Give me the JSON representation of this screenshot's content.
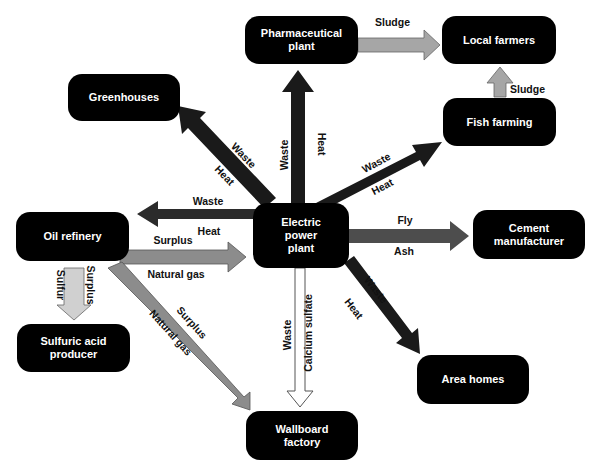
{
  "diagram": {
    "nodes": {
      "pharma": "Pharmaceutical plant",
      "local_farmers": "Local farmers",
      "greenhouses": "Greenhouses",
      "fish_farming": "Fish farming",
      "oil_refinery": "Oil refinery",
      "power_plant": "Electric power plant",
      "cement": "Cement manufacturer",
      "sulfuric": "Sulfuric acid producer",
      "area_homes": "Area homes",
      "wallboard": "Wallboard factory"
    },
    "node_lines": {
      "pharma": [
        "Pharmaceutical",
        "plant"
      ],
      "power_plant": [
        "Electric",
        "power",
        "plant"
      ],
      "cement": [
        "Cement",
        "manufacturer"
      ],
      "sulfuric": [
        "Sulfuric acid",
        "producer"
      ],
      "wallboard": [
        "Wallboard",
        "factory"
      ]
    },
    "flows": [
      {
        "from": "Pharmaceutical plant",
        "to": "Local farmers",
        "labels": [
          "Sludge"
        ],
        "color": "#a6a6a6"
      },
      {
        "from": "Fish farming",
        "to": "Local farmers",
        "labels": [
          "Sludge"
        ],
        "color": "#a6a6a6"
      },
      {
        "from": "Electric power plant",
        "to": "Pharmaceutical plant",
        "labels": [
          "Waste",
          "Heat"
        ],
        "color": "#2b2b2b"
      },
      {
        "from": "Electric power plant",
        "to": "Greenhouses",
        "labels": [
          "Waste",
          "Heat"
        ],
        "color": "#2b2b2b"
      },
      {
        "from": "Electric power plant",
        "to": "Fish farming",
        "labels": [
          "Waste",
          "Heat"
        ],
        "color": "#2b2b2b"
      },
      {
        "from": "Electric power plant",
        "to": "Oil refinery",
        "labels": [
          "Waste",
          "Heat"
        ],
        "color": "#2b2b2b"
      },
      {
        "from": "Oil refinery",
        "to": "Electric power plant",
        "labels": [
          "Surplus",
          "Natural gas"
        ],
        "color": "#8c8c8c"
      },
      {
        "from": "Electric power plant",
        "to": "Cement manufacturer",
        "labels": [
          "Fly",
          "Ash"
        ],
        "color": "#4d4d4d"
      },
      {
        "from": "Electric power plant",
        "to": "Area homes",
        "labels": [
          "Waste",
          "Heat"
        ],
        "color": "#2b2b2b"
      },
      {
        "from": "Electric power plant",
        "to": "Wallboard factory",
        "labels": [
          "Waste",
          "Calcium sulfate"
        ],
        "color": "#ffffff"
      },
      {
        "from": "Oil refinery",
        "to": "Sulfuric acid producer",
        "labels": [
          "Surplus",
          "Sulfur"
        ],
        "color": "#d0d0d0"
      },
      {
        "from": "Oil refinery",
        "to": "Wallboard factory",
        "labels": [
          "Surplus",
          "Natural gas"
        ],
        "color": "#8c8c8c"
      }
    ],
    "labels": {
      "sludge_top": "Sludge",
      "sludge_right": "Sludge",
      "pharma_waste": "Waste",
      "pharma_heat": "Heat",
      "green_waste": "Waste",
      "green_heat": "Heat",
      "fish_waste": "Waste",
      "fish_heat": "Heat",
      "oil_waste": "Waste",
      "oil_heat": "Heat",
      "gas_surplus": "Surplus",
      "gas_natural": "Natural gas",
      "fly": "Fly",
      "ash": "Ash",
      "homes_waste": "Waste",
      "homes_heat": "Heat",
      "wall_waste": "Waste",
      "wall_calcium": "Calcium sulfate",
      "sulfur_surplus": "Surplus",
      "sulfur_sulfur": "Sulfur",
      "wallgas_surplus": "Surplus",
      "wallgas_natural": "Natural gas"
    }
  }
}
